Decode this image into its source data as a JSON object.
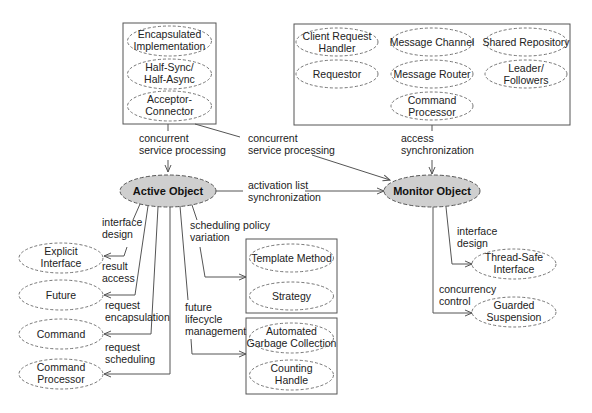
{
  "diagram": {
    "main_nodes": {
      "active_object": "Active Object",
      "monitor_object": "Monitor Object"
    },
    "top_left_group": {
      "patterns": [
        [
          "Encapsulated",
          "Implementation"
        ],
        [
          "Half-Sync/",
          "Half-Async"
        ],
        [
          "Acceptor-",
          "Connector"
        ]
      ]
    },
    "top_right_group": {
      "patterns": [
        [
          "Client Request",
          "Handler"
        ],
        [
          "Message Channel"
        ],
        [
          "Shared Repository"
        ],
        [
          "Requestor"
        ],
        [
          "Message Router"
        ],
        [
          "Leader/",
          "Followers"
        ],
        [
          "Command",
          "Processor"
        ]
      ]
    },
    "scheduling_group": {
      "patterns": [
        [
          "Template Method"
        ],
        [
          "Strategy"
        ]
      ]
    },
    "lifecycle_group": {
      "patterns": [
        [
          "Automated",
          "Garbage Collection"
        ],
        [
          "Counting",
          "Handle"
        ]
      ]
    },
    "active_object_targets": {
      "patterns": [
        [
          "Explicit",
          "Interface"
        ],
        [
          "Future"
        ],
        [
          "Command"
        ],
        [
          "Command",
          "Processor"
        ]
      ]
    },
    "monitor_object_targets": {
      "patterns": [
        [
          "Thread-Safe",
          "Interface"
        ],
        [
          "Guarded",
          "Suspension"
        ]
      ]
    },
    "edge_labels": {
      "left_concurrent": [
        "concurrent",
        "service processing"
      ],
      "cross_concurrent": [
        "concurrent",
        "service processing"
      ],
      "access_sync": [
        "access",
        "synchronization"
      ],
      "activation_list": [
        "activation list",
        "synchronization"
      ],
      "interface_design_ao": [
        "interface",
        "design"
      ],
      "result_access": [
        "result",
        "access"
      ],
      "request_encapsulation": [
        "request",
        "encapsulation"
      ],
      "request_scheduling": [
        "request",
        "scheduling"
      ],
      "scheduling_policy": [
        "scheduling policy",
        "variation"
      ],
      "future_lifecycle": [
        "future",
        "lifecycle",
        "management"
      ],
      "interface_design_mo": [
        "interface",
        "design"
      ],
      "concurrency_control": [
        "concurrency",
        "control"
      ]
    }
  }
}
